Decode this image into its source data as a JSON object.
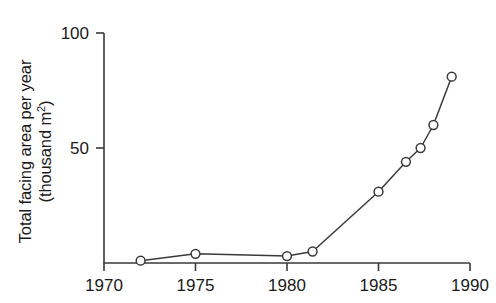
{
  "chart_data": {
    "type": "line",
    "title": "",
    "subtitle": "",
    "xlabel": "",
    "ylabel": "Total facing area per year (thousand m2)",
    "ylabel_line1": "Total facing area per year",
    "ylabel_line2_prefix": "(thousand m",
    "ylabel_line2_superscript": "2",
    "ylabel_line2_suffix": ")",
    "xlim": [
      1970,
      1990
    ],
    "ylim": [
      0,
      100
    ],
    "grid": false,
    "legend": "none",
    "marker": "open-circle",
    "xticks": [
      1970,
      1975,
      1980,
      1985,
      1990
    ],
    "xtick_labels": [
      "1970",
      "1975",
      "1980",
      "1985",
      "1990"
    ],
    "yticks": [
      50,
      100
    ],
    "ytick_labels": [
      "50",
      "100"
    ],
    "series": [
      {
        "name": "Total facing area per year",
        "color": "#3a3a3a",
        "x": [
          1972,
          1975,
          1980,
          1981.4,
          1985,
          1986.5,
          1987.3,
          1988,
          1989
        ],
        "values": [
          1,
          4,
          3,
          5,
          31,
          44,
          50,
          60,
          81
        ]
      }
    ]
  }
}
